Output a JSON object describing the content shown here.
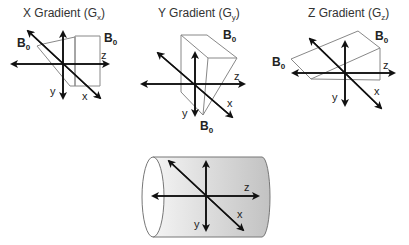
{
  "panels": [
    {
      "title": "X Gradient (G",
      "sub": "x",
      "close": ")",
      "b0_labels": [
        "B0",
        "B0"
      ],
      "axes": {
        "x": "x",
        "y": "y",
        "z": "z"
      }
    },
    {
      "title": "Y Gradient (G",
      "sub": "y",
      "close": ")",
      "b0_labels": [
        "B0",
        "B0"
      ],
      "axes": {
        "x": "x",
        "y": "y",
        "z": "z"
      }
    },
    {
      "title": "Z Gradient (G",
      "sub": "z",
      "close": ")",
      "b0_labels": [
        "B0",
        "B0"
      ],
      "axes": {
        "x": "x",
        "y": "y",
        "z": "z"
      }
    }
  ],
  "bore": {
    "axes": {
      "x": "x",
      "y": "y",
      "z": "z"
    }
  },
  "colors": {
    "axis": "#111111",
    "plane": "#888888",
    "cylinder_light": "#f2f2f2",
    "cylinder_dark": "#c4c4c4"
  }
}
